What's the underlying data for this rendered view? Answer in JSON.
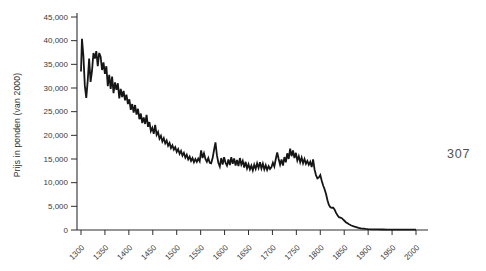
{
  "figure": {
    "page_number": "307",
    "background": "#ffffff"
  },
  "chart_data": {
    "type": "line",
    "title": "",
    "xlabel": "",
    "ylabel": "Prijs in ponden (van 2000)",
    "xlim": [
      1300,
      2000
    ],
    "ylim": [
      0,
      45000
    ],
    "x_ticks": [
      1300,
      1350,
      1400,
      1450,
      1500,
      1550,
      1600,
      1650,
      1700,
      1750,
      1800,
      1850,
      1900,
      1950,
      2000
    ],
    "y_ticks": [
      0,
      5000,
      10000,
      15000,
      20000,
      25000,
      30000,
      35000,
      40000,
      45000
    ],
    "grid": false,
    "legend": false,
    "line_color": "#161616",
    "axis_color": "#2e2e2e",
    "tick_label_color": "#3a3a3a",
    "series": [
      {
        "name": "prijs",
        "points": [
          [
            1300,
            33500
          ],
          [
            1302,
            40400
          ],
          [
            1305,
            36800
          ],
          [
            1308,
            30500
          ],
          [
            1311,
            27900
          ],
          [
            1314,
            31500
          ],
          [
            1317,
            36200
          ],
          [
            1320,
            31300
          ],
          [
            1323,
            33600
          ],
          [
            1326,
            37400
          ],
          [
            1329,
            36200
          ],
          [
            1332,
            37800
          ],
          [
            1335,
            34600
          ],
          [
            1338,
            37400
          ],
          [
            1341,
            36600
          ],
          [
            1344,
            33800
          ],
          [
            1347,
            35400
          ],
          [
            1350,
            33000
          ],
          [
            1353,
            34600
          ],
          [
            1356,
            30400
          ],
          [
            1359,
            32800
          ],
          [
            1362,
            29800
          ],
          [
            1365,
            32400
          ],
          [
            1368,
            28900
          ],
          [
            1371,
            31200
          ],
          [
            1374,
            29600
          ],
          [
            1377,
            31000
          ],
          [
            1380,
            27800
          ],
          [
            1383,
            29800
          ],
          [
            1386,
            28100
          ],
          [
            1389,
            29400
          ],
          [
            1392,
            27400
          ],
          [
            1395,
            28600
          ],
          [
            1398,
            26600
          ],
          [
            1401,
            27600
          ],
          [
            1404,
            25400
          ],
          [
            1407,
            26600
          ],
          [
            1410,
            24800
          ],
          [
            1413,
            26400
          ],
          [
            1416,
            24400
          ],
          [
            1419,
            25600
          ],
          [
            1422,
            23400
          ],
          [
            1425,
            24600
          ],
          [
            1428,
            22600
          ],
          [
            1431,
            23800
          ],
          [
            1434,
            22400
          ],
          [
            1437,
            24300
          ],
          [
            1440,
            21800
          ],
          [
            1443,
            22800
          ],
          [
            1446,
            20900
          ],
          [
            1449,
            21600
          ],
          [
            1452,
            20300
          ],
          [
            1455,
            22200
          ],
          [
            1458,
            20100
          ],
          [
            1461,
            20700
          ],
          [
            1464,
            19300
          ],
          [
            1467,
            19900
          ],
          [
            1470,
            18700
          ],
          [
            1473,
            19400
          ],
          [
            1476,
            18300
          ],
          [
            1479,
            18900
          ],
          [
            1482,
            17800
          ],
          [
            1485,
            18400
          ],
          [
            1488,
            17300
          ],
          [
            1491,
            17900
          ],
          [
            1494,
            17000
          ],
          [
            1497,
            17500
          ],
          [
            1500,
            16500
          ],
          [
            1503,
            17100
          ],
          [
            1506,
            16100
          ],
          [
            1509,
            16700
          ],
          [
            1512,
            15700
          ],
          [
            1515,
            16300
          ],
          [
            1518,
            15300
          ],
          [
            1521,
            15900
          ],
          [
            1524,
            14900
          ],
          [
            1527,
            15500
          ],
          [
            1530,
            14600
          ],
          [
            1533,
            15200
          ],
          [
            1536,
            14300
          ],
          [
            1539,
            15000
          ],
          [
            1542,
            14400
          ],
          [
            1545,
            15100
          ],
          [
            1548,
            14500
          ],
          [
            1551,
            16800
          ],
          [
            1554,
            15200
          ],
          [
            1557,
            16200
          ],
          [
            1560,
            15000
          ],
          [
            1563,
            14400
          ],
          [
            1566,
            15200
          ],
          [
            1569,
            14200
          ],
          [
            1572,
            14100
          ],
          [
            1575,
            15200
          ],
          [
            1578,
            16900
          ],
          [
            1581,
            18500
          ],
          [
            1584,
            15800
          ],
          [
            1587,
            14200
          ],
          [
            1590,
            13400
          ],
          [
            1593,
            15200
          ],
          [
            1596,
            13800
          ],
          [
            1599,
            15400
          ],
          [
            1602,
            14200
          ],
          [
            1605,
            13600
          ],
          [
            1608,
            14900
          ],
          [
            1611,
            13700
          ],
          [
            1614,
            15400
          ],
          [
            1617,
            14000
          ],
          [
            1620,
            15100
          ],
          [
            1623,
            13600
          ],
          [
            1626,
            14800
          ],
          [
            1629,
            13500
          ],
          [
            1632,
            15200
          ],
          [
            1635,
            13800
          ],
          [
            1638,
            14600
          ],
          [
            1641,
            13200
          ],
          [
            1644,
            14400
          ],
          [
            1647,
            13000
          ],
          [
            1650,
            13900
          ],
          [
            1653,
            12800
          ],
          [
            1656,
            13600
          ],
          [
            1659,
            12600
          ],
          [
            1662,
            13800
          ],
          [
            1665,
            12900
          ],
          [
            1668,
            14100
          ],
          [
            1671,
            13100
          ],
          [
            1674,
            14300
          ],
          [
            1677,
            13000
          ],
          [
            1680,
            14000
          ],
          [
            1683,
            12800
          ],
          [
            1686,
            13700
          ],
          [
            1689,
            12700
          ],
          [
            1692,
            13500
          ],
          [
            1695,
            12900
          ],
          [
            1698,
            13300
          ],
          [
            1701,
            14200
          ],
          [
            1704,
            13400
          ],
          [
            1707,
            15000
          ],
          [
            1710,
            16400
          ],
          [
            1713,
            15000
          ],
          [
            1716,
            13800
          ],
          [
            1719,
            14900
          ],
          [
            1722,
            13600
          ],
          [
            1725,
            15400
          ],
          [
            1728,
            14300
          ],
          [
            1731,
            16200
          ],
          [
            1734,
            15000
          ],
          [
            1737,
            17200
          ],
          [
            1740,
            15600
          ],
          [
            1743,
            16800
          ],
          [
            1746,
            15200
          ],
          [
            1749,
            16300
          ],
          [
            1752,
            14700
          ],
          [
            1755,
            15600
          ],
          [
            1758,
            14300
          ],
          [
            1761,
            15300
          ],
          [
            1764,
            14100
          ],
          [
            1767,
            15000
          ],
          [
            1770,
            14000
          ],
          [
            1773,
            14600
          ],
          [
            1776,
            13800
          ],
          [
            1779,
            14400
          ],
          [
            1782,
            13300
          ],
          [
            1785,
            14900
          ],
          [
            1788,
            12800
          ],
          [
            1791,
            11600
          ],
          [
            1794,
            10900
          ],
          [
            1797,
            11100
          ],
          [
            1800,
            11600
          ],
          [
            1803,
            10400
          ],
          [
            1806,
            9400
          ],
          [
            1809,
            8600
          ],
          [
            1812,
            7600
          ],
          [
            1815,
            6300
          ],
          [
            1818,
            5300
          ],
          [
            1821,
            4800
          ],
          [
            1824,
            4700
          ],
          [
            1827,
            4700
          ],
          [
            1830,
            4300
          ],
          [
            1833,
            3600
          ],
          [
            1836,
            3100
          ],
          [
            1839,
            2700
          ],
          [
            1842,
            2600
          ],
          [
            1845,
            2500
          ],
          [
            1848,
            2200
          ],
          [
            1851,
            1900
          ],
          [
            1854,
            1600
          ],
          [
            1857,
            1400
          ],
          [
            1860,
            1200
          ],
          [
            1865,
            950
          ],
          [
            1870,
            750
          ],
          [
            1875,
            600
          ],
          [
            1880,
            450
          ],
          [
            1885,
            350
          ],
          [
            1890,
            280
          ],
          [
            1895,
            220
          ],
          [
            1900,
            180
          ],
          [
            1910,
            140
          ],
          [
            1920,
            120
          ],
          [
            1930,
            110
          ],
          [
            1940,
            100
          ],
          [
            1950,
            90
          ],
          [
            1960,
            85
          ],
          [
            1970,
            80
          ],
          [
            1980,
            75
          ],
          [
            1990,
            70
          ],
          [
            2000,
            65
          ]
        ]
      }
    ]
  }
}
